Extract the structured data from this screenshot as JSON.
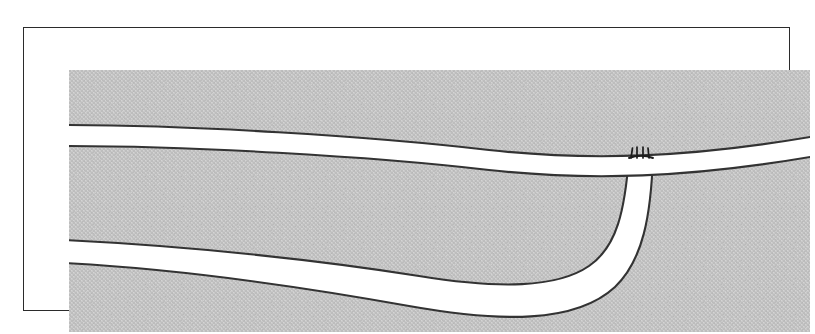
{
  "figure": {
    "kind": "scanned-line-diagram",
    "title": "",
    "caption": "",
    "frame": {
      "border_color": "#2b2b2b",
      "background": "#ffffff"
    },
    "canvas": {
      "fill_label": "stippled-gray-matrix",
      "fill_color": "#c6c6c6",
      "stipple_color": "#b0b0b0",
      "width": 741,
      "height": 262
    },
    "stroke": {
      "color": "#333333",
      "width": 2.0
    },
    "band_fill": "#ffffff",
    "elements": [
      {
        "id": "upper-band",
        "name": "upper-band",
        "label": "upper band",
        "description": "broad white band crossing the full width, gently arching",
        "left_top_y": 55,
        "left_bottom_y": 76,
        "right_top_y": 66,
        "right_bottom_y": 86
      },
      {
        "id": "lower-band",
        "name": "lower-band",
        "label": "lower band",
        "description": "white band entering at left, sweeping right then curving steeply upward to terminate against the base of the upper band",
        "left_top_y": 170,
        "left_bottom_y": 193,
        "terminus_x": 572,
        "terminus_y": 86
      },
      {
        "id": "junction-barbs",
        "name": "junction-barbs",
        "label": "junction tick marks",
        "description": "four short barb ticks marking the contact where the lower band meets the upper band",
        "count": 4,
        "x": 566,
        "y": 86,
        "tick_length": 9
      }
    ]
  }
}
